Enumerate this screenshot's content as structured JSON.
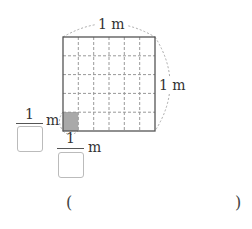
{
  "figure": {
    "grid": {
      "columns": 6,
      "rows": 5,
      "shaded_cell": {
        "column": 1,
        "row": 5
      }
    },
    "colors": {
      "shade": "#a9a9a9",
      "border": "#555555",
      "dash": "#999999"
    },
    "top_label": "1 m",
    "right_label": "1 m",
    "left_fraction": {
      "numerator": "1",
      "unit": "m"
    },
    "bottom_fraction": {
      "numerator": "1",
      "unit": "m"
    }
  },
  "answer": {
    "open_paren": "(",
    "close_paren": ")"
  }
}
